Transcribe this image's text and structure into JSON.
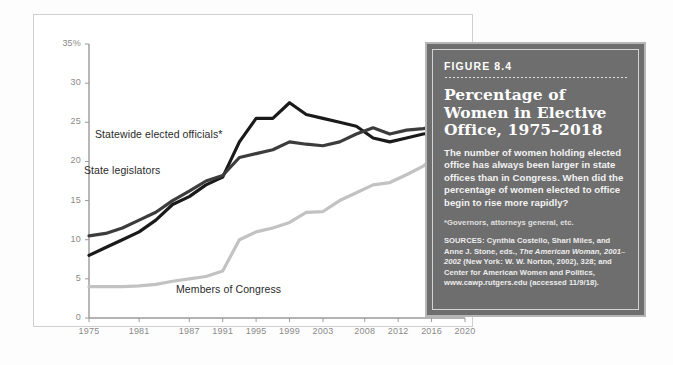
{
  "figure": {
    "number_label": "FIGURE 8.4",
    "title": "Percentage of Women in Elective Office, 1975–2018",
    "description": "The number of women holding elected office has always been larger in state offices than in Congress. When did the percentage of women elected to office begin to rise more rapidly?",
    "footnote": "*Governors, attorneys general, etc.",
    "sources_prefix": "SOURCES: Cynthia Costello, Shari Miles, and Anne J. Stone, eds., ",
    "sources_italic": "The American Woman, 2001–2002",
    "sources_suffix": " (New York: W. W. Norton, 2002), 328; and Center for American Women and Politics, www.cawp.rutgers.edu (accessed 11/9/18).",
    "box_bg": "#6e6e6e",
    "box_border": "#b6b6b6"
  },
  "chart_data": {
    "type": "line",
    "xlabel": "",
    "ylabel": "",
    "ylim": [
      0,
      35
    ],
    "xlim": [
      1975,
      2020
    ],
    "grid": false,
    "legend": "inline-labels",
    "ytick_labels": [
      "0",
      "5",
      "10",
      "15",
      "20",
      "25",
      "30",
      "35%"
    ],
    "ytick_values": [
      0,
      5,
      10,
      15,
      20,
      25,
      30,
      35
    ],
    "xtick_labels": [
      "1975",
      "1981",
      "1987",
      "1991",
      "1995",
      "1999",
      "2003",
      "2008",
      "2012",
      "2016",
      "2020"
    ],
    "xtick_values": [
      1975,
      1981,
      1987,
      1991,
      1995,
      1999,
      2003,
      2008,
      2012,
      2016,
      2020
    ],
    "series": [
      {
        "name": "Statewide elected officials*",
        "color": "#1a1a1a",
        "label_x": 95,
        "label_y": 128,
        "x": [
          1975,
          1977,
          1979,
          1981,
          1983,
          1985,
          1987,
          1989,
          1991,
          1993,
          1995,
          1997,
          1999,
          2001,
          2003,
          2005,
          2007,
          2009,
          2011,
          2013,
          2015,
          2017,
          2018
        ],
        "values": [
          8.0,
          9.0,
          10.0,
          11.0,
          12.5,
          14.5,
          15.5,
          17.0,
          18.0,
          22.5,
          25.5,
          25.5,
          27.5,
          26.0,
          25.5,
          25.0,
          24.5,
          23.0,
          22.5,
          23.0,
          23.5,
          23.7,
          34.7
        ]
      },
      {
        "name": "State legislators",
        "color": "#3c3c3c",
        "label_x": 84,
        "label_y": 164,
        "x": [
          1975,
          1977,
          1979,
          1981,
          1983,
          1985,
          1987,
          1989,
          1991,
          1993,
          1995,
          1997,
          1999,
          2001,
          2003,
          2005,
          2007,
          2009,
          2011,
          2013,
          2015,
          2017,
          2018
        ],
        "values": [
          10.5,
          10.8,
          11.5,
          12.5,
          13.5,
          15.0,
          16.2,
          17.5,
          18.2,
          20.5,
          21.0,
          21.5,
          22.5,
          22.2,
          22.0,
          22.5,
          23.5,
          24.3,
          23.5,
          24.0,
          24.2,
          24.5,
          25.2
        ]
      },
      {
        "name": "Members of Congress",
        "color": "#c2c2c2",
        "label_x": 176,
        "label_y": 283,
        "x": [
          1975,
          1977,
          1979,
          1981,
          1983,
          1985,
          1987,
          1989,
          1991,
          1993,
          1995,
          1997,
          1999,
          2001,
          2003,
          2005,
          2007,
          2009,
          2011,
          2013,
          2015,
          2017,
          2018
        ],
        "values": [
          4.0,
          4.0,
          4.0,
          4.1,
          4.3,
          4.7,
          5.0,
          5.3,
          6.0,
          10.0,
          11.0,
          11.5,
          12.2,
          13.5,
          13.6,
          15.0,
          16.0,
          17.0,
          17.3,
          18.3,
          19.4,
          21.0,
          23.0
        ]
      }
    ]
  }
}
